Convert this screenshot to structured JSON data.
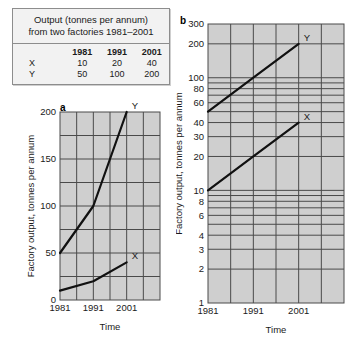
{
  "table": {
    "caption_line1": "Output (tonnes per annum)",
    "caption_line2": "from two factories 1981–2001",
    "columns": [
      "",
      "1981",
      "1991",
      "2001"
    ],
    "rows": [
      {
        "label": "X",
        "values": [
          "10",
          "20",
          "40"
        ]
      },
      {
        "label": "Y",
        "values": [
          "50",
          "100",
          "200"
        ]
      }
    ]
  },
  "chart_data": [
    {
      "type": "line",
      "panel": "a",
      "title": "",
      "xlabel": "Time",
      "ylabel": "Factory output, tonnes per annum",
      "x": [
        "1981",
        "1991",
        "2001"
      ],
      "xtick_labels": [
        "1981",
        "1991",
        "2001"
      ],
      "ytick_labels": [
        "0",
        "50",
        "100",
        "150",
        "200"
      ],
      "ytick_values": [
        0,
        50,
        100,
        150,
        200
      ],
      "yscale": "linear",
      "ylim": [
        0,
        200
      ],
      "xlim": [
        1981,
        2011
      ],
      "grid": true,
      "minor_gridlines_y": [
        25,
        75,
        125,
        175
      ],
      "series": [
        {
          "name": "Y",
          "values": [
            50,
            100,
            200
          ],
          "label_text": "Y"
        },
        {
          "name": "X",
          "values": [
            10,
            20,
            40
          ],
          "label_text": "X"
        }
      ]
    },
    {
      "type": "line",
      "panel": "b",
      "title": "",
      "xlabel": "Time",
      "ylabel": "Factory output, tonnes per annum",
      "x": [
        "1981",
        "1991",
        "2001"
      ],
      "xtick_labels": [
        "1981",
        "1991",
        "2001"
      ],
      "ytick_labels": [
        "300",
        "200",
        "100",
        "80",
        "60",
        "40",
        "30",
        "20",
        "10",
        "8",
        "6",
        "4",
        "3",
        "2",
        "1"
      ],
      "ytick_values": [
        300,
        200,
        100,
        80,
        60,
        40,
        30,
        20,
        10,
        8,
        6,
        4,
        3,
        2,
        1
      ],
      "yscale": "log",
      "ylim": [
        1,
        300
      ],
      "xlim": [
        1981,
        2011
      ],
      "grid": true,
      "minor_gridlines_y": [
        90,
        70,
        50,
        9,
        7,
        5
      ],
      "series": [
        {
          "name": "Y",
          "values": [
            50,
            100,
            200
          ],
          "label_text": "Y"
        },
        {
          "name": "X",
          "values": [
            10,
            20,
            40
          ],
          "label_text": "X"
        }
      ]
    }
  ],
  "colors": {
    "plot_background": "#cfcfcf",
    "gridline": "#4a4a4a",
    "series_line": "#111111",
    "axis": "#333333",
    "card_background": "#f2f2f2",
    "card_border": "#8d8d8d",
    "text": "#1a1a1a"
  }
}
